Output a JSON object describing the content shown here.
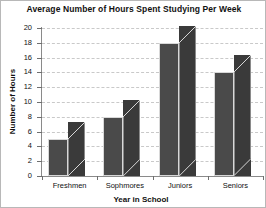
{
  "chart_data": {
    "type": "bar",
    "title": "Average Number of Hours Spent Studying Per Week",
    "xlabel": "Year in School",
    "ylabel": "Number of Hours",
    "categories": [
      "Freshmen",
      "Sophmores",
      "Juniors",
      "Seniors"
    ],
    "values": [
      5,
      8,
      18,
      14
    ],
    "ylim": [
      0,
      20
    ],
    "ytick_labels": [
      "0",
      "2",
      "4",
      "6",
      "8",
      "10",
      "12",
      "14",
      "16",
      "18",
      "20"
    ],
    "ytick_values": [
      0,
      2,
      4,
      6,
      8,
      10,
      12,
      14,
      16,
      18,
      20
    ],
    "grid": true,
    "grid_style": "dashed",
    "legend": "none",
    "style": "3d-bar",
    "colors": {
      "bar_front": "#4a4a4a",
      "bar_side": "#3a3a3a",
      "gridline": "#c9c9c9",
      "axis": "#8a8a8a",
      "text": "#111111",
      "background": "#ffffff",
      "border": "#b8b8b8"
    }
  }
}
